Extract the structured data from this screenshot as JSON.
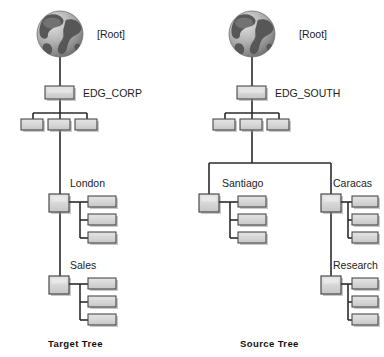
{
  "diagram": {
    "title": "",
    "colors": {
      "box_fill": "#d6d6d6",
      "box_fill_light": "#dedede",
      "box_border": "#4a4a4a",
      "box_shadow": "#8c8c8c",
      "line": "#2b2b2b",
      "text": "#1c1c1c",
      "globe_ocean": "#b9b9b9",
      "globe_land": "#5a5a5a",
      "background": "#ffffff"
    },
    "trees": [
      {
        "id": "target-tree",
        "caption": "Target Tree",
        "root_icon": "globe-icon",
        "root_label": "[Root]",
        "nodes": [
          {
            "id": "edg-corp",
            "label": "EDG_CORP",
            "type": "container",
            "leaf_count": 3
          },
          {
            "id": "london",
            "label": "London",
            "type": "container",
            "leaf_count": 3
          },
          {
            "id": "sales",
            "label": "Sales",
            "type": "container",
            "leaf_count": 3
          }
        ]
      },
      {
        "id": "source-tree",
        "caption": "Source Tree",
        "root_icon": "globe-icon",
        "root_label": "[Root]",
        "nodes": [
          {
            "id": "edg-south",
            "label": "EDG_SOUTH",
            "type": "container",
            "leaf_count": 3
          },
          {
            "id": "santiago",
            "label": "Santiago",
            "type": "container",
            "leaf_count": 3
          },
          {
            "id": "caracas",
            "label": "Caracas",
            "type": "container",
            "leaf_count": 3
          },
          {
            "id": "research",
            "label": "Research",
            "type": "container",
            "leaf_count": 3
          }
        ]
      }
    ]
  }
}
